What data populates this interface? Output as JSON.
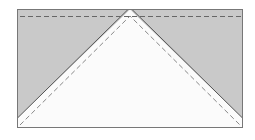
{
  "diagram": {
    "type": "flying-geese-quilt-block",
    "colors": {
      "background_fabric": "#c9c9c9",
      "goose_fabric": "#fbfbfb",
      "outline": "#555555",
      "seam_dash": "#666666"
    },
    "parts": [
      {
        "name": "outer-block",
        "label": ""
      },
      {
        "name": "center-triangle",
        "label": ""
      },
      {
        "name": "left-corner-triangle",
        "label": ""
      },
      {
        "name": "right-corner-triangle",
        "label": ""
      }
    ]
  }
}
